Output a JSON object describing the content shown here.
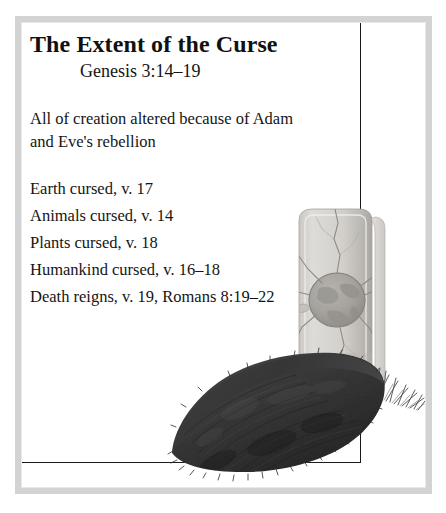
{
  "slide": {
    "title": "The Extent of the Curse",
    "subtitle": "Genesis 3:14–19",
    "lead": "All of creation altered because of Adam and Eve's rebellion",
    "points": [
      "Earth cursed, v. 17",
      "Animals cursed, v. 14",
      "Plants cursed, v. 18",
      "Humankind cursed, v. 16–18",
      "Death reigns, v. 19, Romans 8:19–22"
    ]
  },
  "illustration": {
    "name": "grave-with-tombstone",
    "tombstone_carving": "cracked-earth-globe",
    "elements": [
      "tombstone",
      "globe-carving",
      "cracks",
      "grave-mound",
      "grass-tufts"
    ]
  },
  "style": {
    "frame_color": "#d3d3d3",
    "rule_color": "#1a1a1a",
    "text_color": "#151515",
    "title_color": "#111111",
    "background": "#ffffff",
    "stone_light": "#e4e2de",
    "stone_mid": "#c8c6c1",
    "stone_dark": "#a9a7a2",
    "mound_dark": "#3a3a3a",
    "mound_darker": "#262626"
  }
}
